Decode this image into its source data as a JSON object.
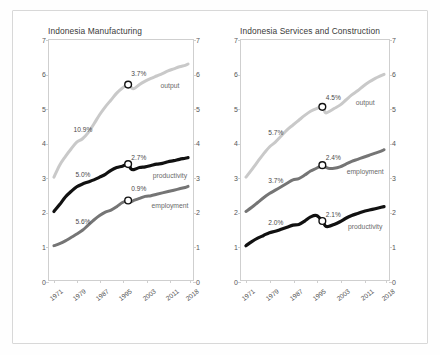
{
  "figure": {
    "panels": [
      {
        "id": "manufacturing",
        "title": "Indonesia Manufacturing",
        "series_labels": {
          "output": "output",
          "productivity": "productivity",
          "employment": "employment"
        },
        "annotations": [
          {
            "name": "output-early-growth",
            "text": "10.9%"
          },
          {
            "name": "output-late-growth",
            "text": "3.7%"
          },
          {
            "name": "productivity-late-growth",
            "text": "2.7%"
          },
          {
            "name": "productivity-early-growth",
            "text": "5.0%"
          },
          {
            "name": "employment-early-growth",
            "text": "5.6%"
          },
          {
            "name": "employment-late-growth",
            "text": "0.9%"
          }
        ]
      },
      {
        "id": "services",
        "title": "Indonesia Services and Construction",
        "series_labels": {
          "output": "output",
          "employment": "employment",
          "productivity": "productivity"
        },
        "annotations": [
          {
            "name": "output-early-growth",
            "text": "5.7%"
          },
          {
            "name": "output-late-growth",
            "text": "4.5%"
          },
          {
            "name": "employment-early-growth",
            "text": "3.7%"
          },
          {
            "name": "employment-late-growth",
            "text": "2.4%"
          },
          {
            "name": "productivity-early-growth",
            "text": "2.0%"
          },
          {
            "name": "productivity-late-growth",
            "text": "2.1%"
          }
        ]
      }
    ],
    "ytick_labels": [
      "0",
      "1",
      "2",
      "3",
      "4",
      "5",
      "6",
      "7"
    ],
    "xtick_labels": [
      "1971",
      "1979",
      "1987",
      "1995",
      "2003",
      "2011",
      "2018"
    ]
  },
  "colors": {
    "output": "#c9c9c9",
    "mid_gray": "#757575",
    "black": "#111111",
    "axis": "#cfcfcf",
    "text": "#4a4a4a",
    "frame": "#d8d8d8"
  },
  "chart_data": {
    "type": "line",
    "xlabel": "",
    "ylabel": "",
    "xlim": [
      1971,
      2018
    ],
    "ylim": [
      0,
      7
    ],
    "grid": false,
    "legend": "inline-labels",
    "ytick_values": [
      0,
      1,
      2,
      3,
      4,
      5,
      6,
      7
    ],
    "xtick_values": [
      1971,
      1979,
      1987,
      1995,
      2003,
      2011,
      2018
    ],
    "note": "Indexed log-levels; inline percentages are annualised growth rates before and after the 1997-98 crisis marker (open circle).",
    "panels": [
      {
        "title": "Indonesia Manufacturing",
        "x": [
          1971,
          1973,
          1975,
          1977,
          1979,
          1981,
          1983,
          1985,
          1987,
          1989,
          1991,
          1993,
          1995,
          1997,
          1998,
          1999,
          2001,
          2003,
          2005,
          2007,
          2009,
          2011,
          2013,
          2015,
          2017,
          2018
        ],
        "series": [
          {
            "name": "output",
            "color": "#c9c9c9",
            "growth_before": "10.9%",
            "growth_after": "3.7%",
            "marker_year": 1997,
            "marker_value": 5.7,
            "values": [
              3.0,
              3.35,
              3.6,
              3.82,
              4.02,
              4.12,
              4.3,
              4.55,
              4.82,
              5.05,
              5.25,
              5.45,
              5.6,
              5.7,
              5.62,
              5.58,
              5.7,
              5.8,
              5.88,
              5.95,
              6.02,
              6.1,
              6.16,
              6.22,
              6.26,
              6.3
            ]
          },
          {
            "name": "productivity",
            "color": "#111111",
            "growth_before": "5.0%",
            "growth_after": "2.7%",
            "marker_year": 1997,
            "marker_value": 3.38,
            "values": [
              2.0,
              2.2,
              2.42,
              2.58,
              2.72,
              2.8,
              2.86,
              2.92,
              3.0,
              3.08,
              3.2,
              3.28,
              3.32,
              3.38,
              3.24,
              3.22,
              3.28,
              3.3,
              3.34,
              3.38,
              3.4,
              3.45,
              3.48,
              3.52,
              3.55,
              3.57
            ]
          },
          {
            "name": "employment",
            "color": "#757575",
            "growth_before": "5.6%",
            "growth_after": "0.9%",
            "marker_year": 1997,
            "marker_value": 2.32,
            "values": [
              1.0,
              1.06,
              1.14,
              1.24,
              1.34,
              1.45,
              1.6,
              1.75,
              1.88,
              1.98,
              2.04,
              2.14,
              2.26,
              2.32,
              2.28,
              2.32,
              2.38,
              2.44,
              2.46,
              2.5,
              2.54,
              2.58,
              2.62,
              2.66,
              2.7,
              2.73
            ]
          }
        ]
      },
      {
        "title": "Indonesia Services and Construction",
        "x": [
          1971,
          1973,
          1975,
          1977,
          1979,
          1981,
          1983,
          1985,
          1987,
          1989,
          1991,
          1993,
          1995,
          1997,
          1998,
          1999,
          2001,
          2003,
          2005,
          2007,
          2009,
          2011,
          2013,
          2015,
          2017,
          2018
        ],
        "series": [
          {
            "name": "output",
            "color": "#c9c9c9",
            "growth_before": "5.7%",
            "growth_after": "4.5%",
            "marker_year": 1997,
            "marker_value": 5.05,
            "values": [
              3.0,
              3.22,
              3.45,
              3.68,
              3.88,
              4.02,
              4.2,
              4.38,
              4.52,
              4.66,
              4.8,
              4.92,
              5.0,
              5.05,
              4.88,
              4.9,
              5.0,
              5.1,
              5.25,
              5.4,
              5.52,
              5.66,
              5.78,
              5.88,
              5.96,
              6.0
            ]
          },
          {
            "name": "employment",
            "color": "#757575",
            "growth_before": "3.7%",
            "growth_after": "2.4%",
            "marker_year": 1997,
            "marker_value": 3.35,
            "values": [
              2.0,
              2.12,
              2.26,
              2.4,
              2.52,
              2.62,
              2.72,
              2.82,
              2.92,
              2.96,
              3.06,
              3.18,
              3.26,
              3.35,
              3.3,
              3.26,
              3.26,
              3.3,
              3.38,
              3.46,
              3.52,
              3.58,
              3.64,
              3.7,
              3.76,
              3.8
            ]
          },
          {
            "name": "productivity",
            "color": "#111111",
            "growth_before": "2.0%",
            "growth_after": "2.1%",
            "marker_year": 1997,
            "marker_value": 1.72,
            "values": [
              1.0,
              1.12,
              1.22,
              1.3,
              1.38,
              1.42,
              1.48,
              1.54,
              1.6,
              1.62,
              1.72,
              1.84,
              1.88,
              1.72,
              1.58,
              1.56,
              1.62,
              1.7,
              1.8,
              1.88,
              1.94,
              2.0,
              2.04,
              2.08,
              2.12,
              2.14
            ]
          }
        ]
      }
    ]
  }
}
